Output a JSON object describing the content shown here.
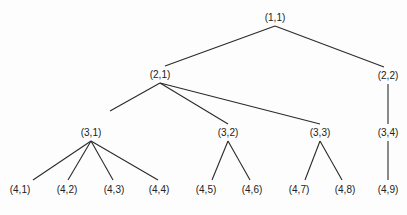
{
  "diagram": {
    "type": "tree",
    "nodes": [
      {
        "id": "1,1",
        "label": "(1,1)",
        "x": 275,
        "y": 18,
        "ax": 275,
        "ay": 26
      },
      {
        "id": "2,1",
        "label": "(2,1)",
        "x": 160,
        "y": 75,
        "ax": 160,
        "ay": 83
      },
      {
        "id": "2,2",
        "label": "(2,2)",
        "x": 388,
        "y": 76,
        "ax": 388,
        "ay": 84
      },
      {
        "id": "3,1",
        "label": "(3,1)",
        "x": 91,
        "y": 133,
        "ax": 91,
        "ay": 141
      },
      {
        "id": "3,2",
        "label": "(3,2)",
        "x": 228,
        "y": 133,
        "ax": 228,
        "ay": 141
      },
      {
        "id": "3,3",
        "label": "(3,3)",
        "x": 320,
        "y": 133,
        "ax": 320,
        "ay": 141
      },
      {
        "id": "3,4",
        "label": "(3,4)",
        "x": 388,
        "y": 133,
        "ax": 388,
        "ay": 141
      },
      {
        "id": "4,1",
        "label": "(4,1)",
        "x": 20,
        "y": 190
      },
      {
        "id": "4,2",
        "label": "(4,2)",
        "x": 67,
        "y": 190
      },
      {
        "id": "4,3",
        "label": "(4,3)",
        "x": 114,
        "y": 190
      },
      {
        "id": "4,4",
        "label": "(4,4)",
        "x": 159,
        "y": 190
      },
      {
        "id": "4,5",
        "label": "(4,5)",
        "x": 206,
        "y": 190
      },
      {
        "id": "4,6",
        "label": "(4,6)",
        "x": 252,
        "y": 190
      },
      {
        "id": "4,7",
        "label": "(4,7)",
        "x": 299,
        "y": 190
      },
      {
        "id": "4,8",
        "label": "(4,8)",
        "x": 345,
        "y": 190
      },
      {
        "id": "4,9",
        "label": "(4,9)",
        "x": 388,
        "y": 190
      }
    ],
    "edges": [
      {
        "from": "1,1",
        "to": "2,1",
        "x1": 275,
        "y1": 26,
        "x2": 165,
        "y2": 66
      },
      {
        "from": "1,1",
        "to": "2,2",
        "x1": 275,
        "y1": 26,
        "x2": 384,
        "y2": 67
      },
      {
        "from": "2,1",
        "to": "3,1",
        "x1": 160,
        "y1": 83,
        "x2": 110,
        "y2": 111
      },
      {
        "from": "2,1",
        "to": "3,2",
        "x1": 160,
        "y1": 83,
        "x2": 228,
        "y2": 124
      },
      {
        "from": "2,1",
        "to": "3,3",
        "x1": 160,
        "y1": 83,
        "x2": 320,
        "y2": 124
      },
      {
        "from": "2,2",
        "to": "3,4",
        "x1": 388,
        "y1": 84,
        "x2": 388,
        "y2": 124
      },
      {
        "from": "3,1",
        "to": "4,1",
        "x1": 91,
        "y1": 141,
        "x2": 33,
        "y2": 180
      },
      {
        "from": "3,1",
        "to": "4,2",
        "x1": 91,
        "y1": 141,
        "x2": 68,
        "y2": 180
      },
      {
        "from": "3,1",
        "to": "4,3",
        "x1": 91,
        "y1": 141,
        "x2": 113,
        "y2": 180
      },
      {
        "from": "3,1",
        "to": "4,4",
        "x1": 91,
        "y1": 141,
        "x2": 158,
        "y2": 180
      },
      {
        "from": "3,2",
        "to": "4,5",
        "x1": 228,
        "y1": 141,
        "x2": 212,
        "y2": 180
      },
      {
        "from": "3,2",
        "to": "4,6",
        "x1": 228,
        "y1": 141,
        "x2": 250,
        "y2": 180
      },
      {
        "from": "3,3",
        "to": "4,7",
        "x1": 320,
        "y1": 141,
        "x2": 305,
        "y2": 180
      },
      {
        "from": "3,3",
        "to": "4,8",
        "x1": 320,
        "y1": 141,
        "x2": 342,
        "y2": 180
      },
      {
        "from": "3,4",
        "to": "4,9",
        "x1": 388,
        "y1": 141,
        "x2": 388,
        "y2": 180
      }
    ]
  }
}
